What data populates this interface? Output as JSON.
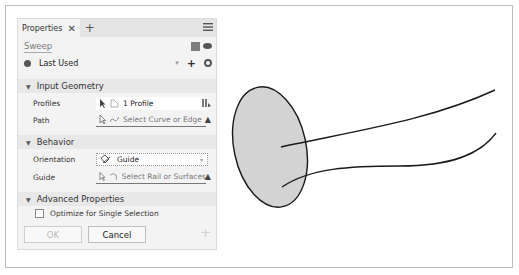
{
  "panel": {
    "tab_label": "Properties",
    "close_glyph": "✕",
    "add_tab_glyph": "+",
    "feature_title": "Sweep",
    "preset": {
      "label": "Last Used",
      "caret": "▾",
      "plus": "+"
    },
    "sections": {
      "input_geometry": {
        "title": "Input Geometry",
        "profiles": {
          "label": "Profiles",
          "value": "1 Profile"
        },
        "path": {
          "label": "Path",
          "placeholder": "Select Curve or Edge",
          "warning": "▲"
        }
      },
      "behavior": {
        "title": "Behavior",
        "orientation": {
          "label": "Orientation",
          "value": "Guide",
          "caret": "▾"
        },
        "guide": {
          "label": "Guide",
          "placeholder": "Select Rail or Surfaces",
          "warning": "▲"
        }
      },
      "advanced": {
        "title": "Advanced Properties",
        "optimize": {
          "label": "Optimize for Single Selection",
          "checked": false
        }
      }
    },
    "buttons": {
      "ok": "OK",
      "cancel": "Cancel",
      "add": "+"
    },
    "section_toggle": "▼"
  },
  "icons": {
    "menu": "hamburger-menu-icon",
    "cube": "cube-icon",
    "eye": "eye-icon",
    "preset": "preset-icon",
    "gear": "gear-icon",
    "select_arrow": "select-arrow-icon",
    "profile": "profile-icon",
    "curve": "curve-icon",
    "chain": "chain-icon",
    "guide": "guide-icon",
    "rail": "rail-icon",
    "warning": "warning-icon"
  },
  "colors": {
    "panel_bg": "#f3f3f3",
    "section_bg": "#e8e8e8",
    "titlebar_bg": "#e4e4e4",
    "profile_fill": "#d3d3d3",
    "curve_stroke": "#1a1a1a"
  }
}
